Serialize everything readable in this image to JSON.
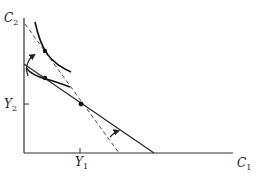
{
  "diagram": {
    "type": "intertemporal-consumption",
    "axes": {
      "x_label": "C",
      "x_label_sub": "1",
      "y_label": "C",
      "y_label_sub": "2"
    },
    "ticks": {
      "x_tick_label": "Y",
      "x_tick_label_sub": "1",
      "y_tick_label": "Y",
      "y_tick_label_sub": "2"
    },
    "elements": [
      {
        "name": "budget-line",
        "style": "solid",
        "description": "Initial budget constraint through endowment point (Y1, Y2)"
      },
      {
        "name": "rotated-budget-line",
        "style": "dashed",
        "description": "Steeper budget constraint pivoted around endowment point"
      },
      {
        "name": "indifference-curve-low",
        "style": "solid",
        "description": "Initial indifference curve tangent to solid budget line"
      },
      {
        "name": "indifference-curve-high",
        "style": "solid",
        "description": "New indifference curve tangent to dashed budget line"
      },
      {
        "name": "endowment-point",
        "description": "Point (Y1, Y2)"
      },
      {
        "name": "rotation-arrow",
        "description": "Arrow showing pivot of budget line"
      },
      {
        "name": "shift-arrow",
        "description": "Curved arrow from lower to higher optimum"
      }
    ],
    "colors": {
      "line": "#222222",
      "background": "#ffffff"
    }
  }
}
